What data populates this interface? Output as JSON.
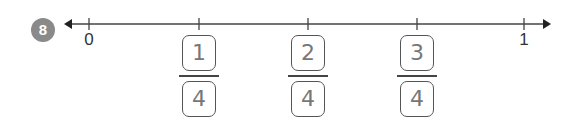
{
  "problem": {
    "number": "8"
  },
  "number_line": {
    "start_label": "0",
    "end_label": "1",
    "ticks_x": [
      89,
      199,
      308,
      417,
      524
    ],
    "line_y": 24,
    "line_color": "#444444"
  },
  "answers": [
    {
      "numerator": "1",
      "denominator": "4",
      "x": 199
    },
    {
      "numerator": "2",
      "denominator": "4",
      "x": 308
    },
    {
      "numerator": "3",
      "denominator": "4",
      "x": 417
    }
  ]
}
